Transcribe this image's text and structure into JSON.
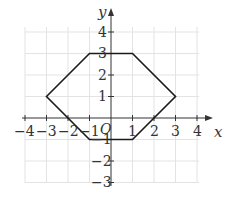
{
  "diagram": {
    "type": "coordinate-plane-polygon",
    "axes": {
      "x_label": "x",
      "y_label": "y",
      "origin_label": "O",
      "x_range": [
        -4,
        4
      ],
      "y_range": [
        -3,
        4
      ],
      "x_ticks": [
        "−4",
        "−3",
        "−2",
        "−1",
        "1",
        "2",
        "3",
        "4"
      ],
      "y_ticks": [
        "4",
        "3",
        "2",
        "1",
        "−1",
        "−2",
        "−3"
      ]
    },
    "polygon": {
      "name": "hexagon",
      "vertices": [
        [
          -3,
          1
        ],
        [
          -1,
          3
        ],
        [
          1,
          3
        ],
        [
          3,
          1
        ],
        [
          1,
          -1
        ],
        [
          -1,
          -1
        ]
      ],
      "stroke": "#1a1a1a"
    },
    "grid": true
  }
}
